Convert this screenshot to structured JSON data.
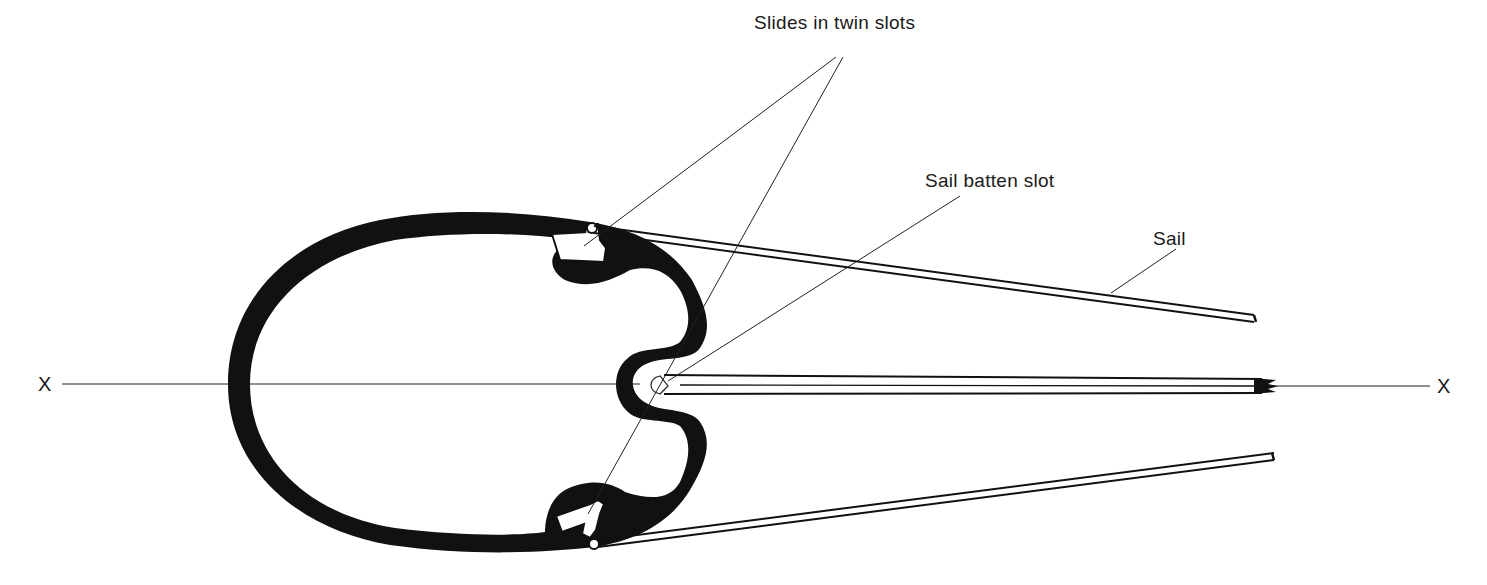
{
  "diagram": {
    "type": "cross-section",
    "labels": {
      "slides": "Slides in twin slots",
      "batten_slot": "Sail batten slot",
      "sail": "Sail"
    },
    "axis": {
      "left_marker": "X",
      "right_marker": "X"
    },
    "colors": {
      "ink": "#111111",
      "background": "#ffffff",
      "text": "#1a1a1a"
    }
  }
}
